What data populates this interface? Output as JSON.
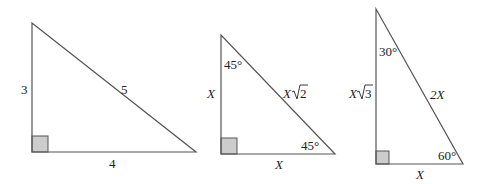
{
  "diagram": {
    "line_color": "#555555",
    "right_angle_fill": "#cccccc",
    "triangles": [
      {
        "name": "3-4-5 triangle",
        "vertical_leg": "3",
        "hypotenuse": "5",
        "horizontal_leg": "4"
      },
      {
        "name": "45-45-90 triangle",
        "vertical_leg": "X",
        "hypotenuse_coef": "X",
        "hypotenuse_radicand": "2",
        "horizontal_leg": "X",
        "top_angle": "45°",
        "right_angle_label": "45°"
      },
      {
        "name": "30-60-90 triangle",
        "vertical_leg_coef": "X",
        "vertical_leg_radicand": "3",
        "hypotenuse": "2X",
        "horizontal_leg": "X",
        "top_angle": "30°",
        "right_angle_label": "60°"
      }
    ]
  }
}
